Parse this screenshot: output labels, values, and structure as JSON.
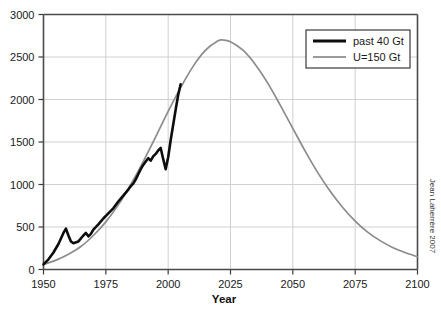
{
  "chart_data": {
    "type": "line",
    "title": "",
    "subtitle": "",
    "xlabel": "Year",
    "ylabel": "",
    "xlim": [
      1950,
      2100
    ],
    "ylim": [
      0,
      3000
    ],
    "xticks": [
      1950,
      1975,
      2000,
      2025,
      2050,
      2075,
      2100
    ],
    "xtick_labels": [
      "1950",
      "1975",
      "2000",
      "2025",
      "2050",
      "2075",
      "2100"
    ],
    "yticks": [
      0,
      500,
      1000,
      1500,
      2000,
      2500,
      3000
    ],
    "ytick_labels": [
      "0",
      "500",
      "1000",
      "1500",
      "2000",
      "2500",
      "3000"
    ],
    "grid": true,
    "legend_position": "top-right",
    "annotations": [
      {
        "name": "credit",
        "text": "Jean Laherrère 2007",
        "rotation": 90,
        "position": "right-margin"
      }
    ],
    "series": [
      {
        "name": "past 40 Gt",
        "color": "#0d0d0d",
        "style": "solid-thick",
        "x": [
          1950,
          1952,
          1954,
          1956,
          1958,
          1959,
          1960,
          1961,
          1962,
          1964,
          1966,
          1967,
          1968,
          1969,
          1970,
          1972,
          1974,
          1976,
          1978,
          1980,
          1982,
          1984,
          1985,
          1986,
          1987,
          1988,
          1989,
          1990,
          1991,
          1992,
          1993,
          1994,
          1995,
          1996,
          1997,
          1998,
          1999,
          2000,
          2001,
          2002,
          2003,
          2004,
          2005
        ],
        "y": [
          60,
          120,
          200,
          300,
          430,
          480,
          400,
          330,
          310,
          330,
          400,
          430,
          390,
          420,
          470,
          530,
          600,
          660,
          720,
          800,
          870,
          940,
          980,
          1010,
          1060,
          1120,
          1180,
          1230,
          1270,
          1310,
          1280,
          1330,
          1360,
          1400,
          1430,
          1300,
          1180,
          1320,
          1520,
          1700,
          1880,
          2050,
          2180
        ]
      },
      {
        "name": "U=150 Gt",
        "color": "#8c8c8c",
        "style": "solid-thin",
        "x": [
          1950,
          1955,
          1960,
          1965,
          1970,
          1975,
          1980,
          1985,
          1990,
          1995,
          2000,
          2005,
          2010,
          2015,
          2020,
          2022,
          2025,
          2030,
          2035,
          2040,
          2045,
          2050,
          2055,
          2060,
          2065,
          2070,
          2075,
          2080,
          2085,
          2090,
          2095,
          2100
        ],
        "y": [
          60,
          110,
          180,
          270,
          400,
          560,
          760,
          1000,
          1270,
          1560,
          1860,
          2140,
          2390,
          2580,
          2690,
          2700,
          2680,
          2580,
          2410,
          2190,
          1930,
          1660,
          1390,
          1140,
          920,
          730,
          570,
          440,
          340,
          260,
          200,
          150
        ]
      }
    ]
  },
  "legend": {
    "items": [
      {
        "label": "past 40 Gt",
        "swatch": "black-thick-line"
      },
      {
        "label": "U=150 Gt",
        "swatch": "gray-thin-line"
      }
    ]
  },
  "axes": {
    "x_title": "Year"
  },
  "credit": {
    "text": "Jean Laherrère 2007"
  },
  "colors": {
    "past_series": "#0d0d0d",
    "model_series": "#8c8c8c",
    "grid": "#d0d0d0",
    "frame": "#4a4a4a",
    "background": "#ffffff"
  }
}
